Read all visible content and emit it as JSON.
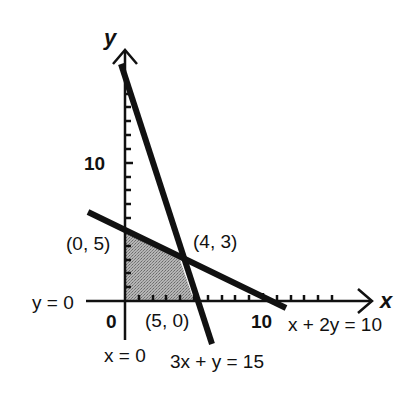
{
  "diagram": {
    "axes": {
      "x_label": "x",
      "y_label": "y",
      "origin_label": "0",
      "x_tick_label": "10",
      "y_tick_label": "10"
    },
    "boundary_labels": {
      "y_axis_eq": "y = 0",
      "x_axis_eq": "x = 0",
      "line1_eq": "3x + y = 15",
      "line2_eq": "x + 2y = 10"
    },
    "vertices": {
      "v1": "(0, 5)",
      "v2": "(4, 3)",
      "v3": "(5, 0)"
    },
    "colors": {
      "line": "#111111",
      "region_fill": "#9a9a9a"
    }
  }
}
